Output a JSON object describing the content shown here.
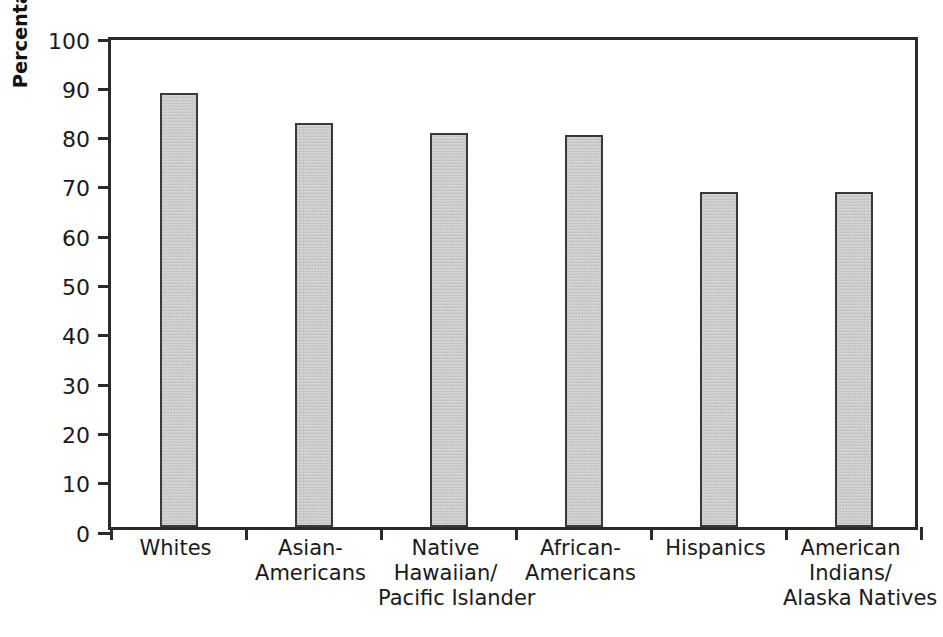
{
  "chart_data": {
    "type": "bar",
    "title": "",
    "xlabel": "",
    "ylabel": "Percentage of Americans with health insurance",
    "ylim": [
      0,
      100
    ],
    "ytick_step": 10,
    "yticks": [
      0,
      10,
      20,
      30,
      40,
      50,
      60,
      70,
      80,
      90,
      100
    ],
    "ytick_labels": [
      "0",
      "10",
      "20",
      "30",
      "40",
      "50",
      "60",
      "70",
      "80",
      "90",
      "100"
    ],
    "grid": false,
    "legend": null,
    "categories": [
      "Whites",
      "Asian-Americans",
      "Native Hawaiian/Pacific Islander",
      "African-Americans",
      "Hispanics",
      "American Indians/Alaska Natives"
    ],
    "category_label_lines": [
      [
        "Whites"
      ],
      [
        "Asian-",
        "Americans"
      ],
      [
        "Native",
        "Hawaiian/",
        "Pacific Islander"
      ],
      [
        "African-",
        "Americans"
      ],
      [
        "Hispanics"
      ],
      [
        "American",
        "Indians/",
        "Alaska Natives"
      ]
    ],
    "values": [
      88,
      82,
      80,
      79.5,
      68,
      68
    ],
    "bar_fill_color": "#cccccc",
    "bar_border_color": "#3a3a3a",
    "axis_color": "#2b2b2b",
    "background_color": "#ffffff"
  }
}
